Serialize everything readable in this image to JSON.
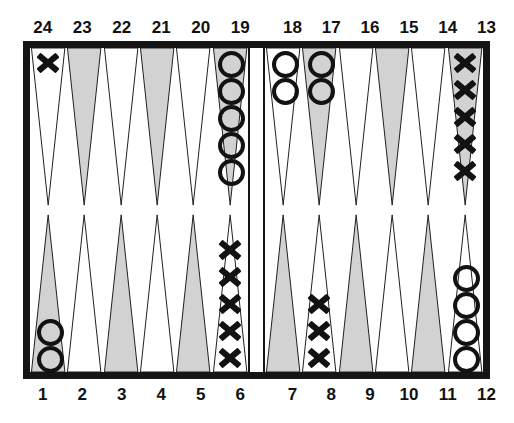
{
  "board": {
    "title": "Backgammon board diagram",
    "colors": {
      "frame": "#151515",
      "point_shaded": "#d2d2d2",
      "point_light": "#ffffff",
      "point_outline": "#202020",
      "checker": "#121212",
      "background": "#ffffff"
    },
    "bar": {
      "label": "bar"
    },
    "top_labels_left": [
      "24",
      "23",
      "22",
      "21",
      "20",
      "19"
    ],
    "top_labels_right": [
      "18",
      "17",
      "16",
      "15",
      "14",
      "13"
    ],
    "bottom_labels_left": [
      "1",
      "2",
      "3",
      "4",
      "5",
      "6"
    ],
    "bottom_labels_right": [
      "7",
      "8",
      "9",
      "10",
      "11",
      "12"
    ],
    "points": {
      "top_left": [
        {
          "number": "24",
          "shaded": false,
          "checker": "X",
          "count": 1
        },
        {
          "number": "23",
          "shaded": true,
          "checker": "",
          "count": 0
        },
        {
          "number": "22",
          "shaded": false,
          "checker": "",
          "count": 0
        },
        {
          "number": "21",
          "shaded": true,
          "checker": "",
          "count": 0
        },
        {
          "number": "20",
          "shaded": false,
          "checker": "",
          "count": 0
        },
        {
          "number": "19",
          "shaded": true,
          "checker": "O",
          "count": 5
        }
      ],
      "top_right": [
        {
          "number": "18",
          "shaded": false,
          "checker": "O",
          "count": 2
        },
        {
          "number": "17",
          "shaded": true,
          "checker": "O",
          "count": 2
        },
        {
          "number": "16",
          "shaded": false,
          "checker": "",
          "count": 0
        },
        {
          "number": "15",
          "shaded": true,
          "checker": "",
          "count": 0
        },
        {
          "number": "14",
          "shaded": false,
          "checker": "",
          "count": 0
        },
        {
          "number": "13",
          "shaded": true,
          "checker": "X",
          "count": 5
        }
      ],
      "bottom_left": [
        {
          "number": "1",
          "shaded": true,
          "checker": "O",
          "count": 2
        },
        {
          "number": "2",
          "shaded": false,
          "checker": "",
          "count": 0
        },
        {
          "number": "3",
          "shaded": true,
          "checker": "",
          "count": 0
        },
        {
          "number": "4",
          "shaded": false,
          "checker": "",
          "count": 0
        },
        {
          "number": "5",
          "shaded": true,
          "checker": "",
          "count": 0
        },
        {
          "number": "6",
          "shaded": false,
          "checker": "X",
          "count": 5
        }
      ],
      "bottom_right": [
        {
          "number": "7",
          "shaded": true,
          "checker": "",
          "count": 0
        },
        {
          "number": "8",
          "shaded": false,
          "checker": "X",
          "count": 3
        },
        {
          "number": "9",
          "shaded": true,
          "checker": "",
          "count": 0
        },
        {
          "number": "10",
          "shaded": false,
          "checker": "",
          "count": 0
        },
        {
          "number": "11",
          "shaded": true,
          "checker": "",
          "count": 0
        },
        {
          "number": "12",
          "shaded": false,
          "checker": "O",
          "count": 4
        }
      ]
    }
  }
}
